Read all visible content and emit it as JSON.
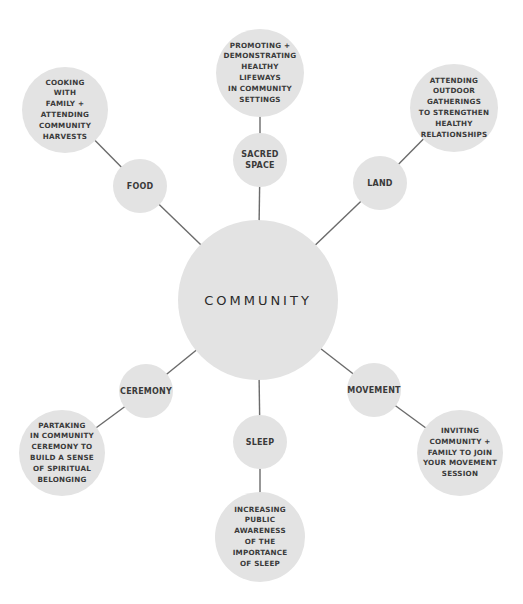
{
  "diagram": {
    "colors": {
      "node_fill": "#e3e3e3",
      "line": "#6b6b6b",
      "text": "#3a3a3a",
      "background": "#ffffff"
    },
    "center": {
      "label": "COMMUNITY",
      "x": 258,
      "y": 300,
      "r": 80
    },
    "branches": [
      {
        "category": {
          "label": "SACRED\nSPACE",
          "x": 260,
          "y": 160,
          "r": 27
        },
        "leaf": {
          "label": "PROMOTING +\nDEMONSTRATING\nHEALTHY\nLIFEWAYS\nIN COMMUNITY\nSETTINGS",
          "x": 260,
          "y": 73,
          "r": 44
        }
      },
      {
        "category": {
          "label": "FOOD",
          "x": 140,
          "y": 186,
          "r": 27
        },
        "leaf": {
          "label": "COOKING\nWITH\nFAMILY +\nATTENDING\nCOMMUNITY\nHARVESTS",
          "x": 65,
          "y": 110,
          "r": 43
        }
      },
      {
        "category": {
          "label": "LAND",
          "x": 380,
          "y": 183,
          "r": 27
        },
        "leaf": {
          "label": "ATTENDING\nOUTDOOR\nGATHERINGS\nTO STRENGTHEN\nHEALTHY\nRELATIONSHIPS",
          "x": 454,
          "y": 108,
          "r": 44
        }
      },
      {
        "category": {
          "label": "CEREMONY",
          "x": 146,
          "y": 391,
          "r": 27
        },
        "leaf": {
          "label": "PARTAKING\nIN COMMUNITY\nCEREMONY TO\nBUILD A SENSE\nOF SPIRITUAL\nBELONGING",
          "x": 62,
          "y": 453,
          "r": 43
        }
      },
      {
        "category": {
          "label": "SLEEP",
          "x": 260,
          "y": 442,
          "r": 27
        },
        "leaf": {
          "label": "INCREASING\nPUBLIC\nAWARENESS\nOF THE\nIMPORTANCE\nOF SLEEP",
          "x": 260,
          "y": 537,
          "r": 45
        }
      },
      {
        "category": {
          "label": "MOVEMENT",
          "x": 374,
          "y": 390,
          "r": 27
        },
        "leaf": {
          "label": "INVITING\nCOMMUNITY +\nFAMILY TO JOIN\nYOUR MOVEMENT\nSESSION",
          "x": 460,
          "y": 453,
          "r": 43
        }
      }
    ]
  }
}
